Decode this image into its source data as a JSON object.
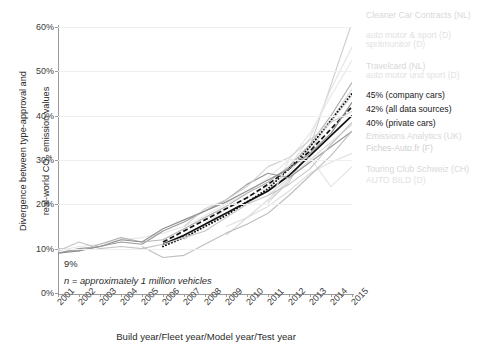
{
  "chart_data": {
    "type": "line",
    "title": "",
    "xlabel": "Build year/Fleet year/Model year/Test year",
    "ylabel": "Divergence between type-approval and real-world CO2 emission values",
    "ylabel_line1": "Divergence between type-approval and",
    "ylabel_line2_a": "real-world CO",
    "ylabel_line2_sub": "2",
    "ylabel_line2_b": " emission values",
    "categories": [
      "2001",
      "2002",
      "2003",
      "2004",
      "2005",
      "2006",
      "2007",
      "2008",
      "2009",
      "2010",
      "2011",
      "2012",
      "2013",
      "2014",
      "2015"
    ],
    "x": [
      2001,
      2002,
      2003,
      2004,
      2005,
      2006,
      2007,
      2008,
      2009,
      2010,
      2011,
      2012,
      2013,
      2014,
      2015
    ],
    "ylim": [
      0,
      60
    ],
    "yticks": [
      "0%",
      "10%",
      "20%",
      "30%",
      "40%",
      "50%",
      "60%"
    ],
    "ytick_values": [
      0,
      10,
      20,
      30,
      40,
      50,
      60
    ],
    "grid": true,
    "legend_position": "right-inline",
    "annotations": [
      {
        "text": "9%",
        "x": 2001,
        "y": 9
      },
      {
        "text": "n = approximately 1 million vehicles",
        "x": 2001,
        "y": 4,
        "italic": true
      }
    ],
    "series": [
      {
        "name": "Cleaner Car Contracts (NL)",
        "label": "Cleaner Car Contracts (NL)",
        "style": "solid",
        "color": "#cdcdcd",
        "weight": "faint",
        "values": [
          null,
          null,
          null,
          null,
          null,
          null,
          null,
          null,
          null,
          null,
          20.5,
          25.0,
          33.0,
          47.0,
          61.0
        ]
      },
      {
        "name": "auto motor & sport (D)",
        "label": "auto motor & sport (D)",
        "style": "solid",
        "color": "#e4e4e4",
        "weight": "faint2",
        "values": [
          null,
          null,
          null,
          null,
          null,
          null,
          12.0,
          15.5,
          19.0,
          21.5,
          24.0,
          28.5,
          35.0,
          46.0,
          55.5
        ]
      },
      {
        "name": "spritmonitor (D)",
        "label": "spritmonitor (D)",
        "style": "solid",
        "color": "#e8e8e8",
        "weight": "faint2",
        "values": [
          9.5,
          10.5,
          11.0,
          12.0,
          12.5,
          13.5,
          15.0,
          17.5,
          20.0,
          22.5,
          26.0,
          30.0,
          36.0,
          44.5,
          52.5
        ]
      },
      {
        "name": "Travelcard (NL)",
        "label": "Travelcard (NL)",
        "style": "solid",
        "color": "#d6d6d6",
        "weight": "faint",
        "values": [
          null,
          null,
          null,
          null,
          null,
          null,
          null,
          null,
          13.0,
          17.0,
          21.0,
          25.5,
          32.0,
          39.0,
          46.0
        ]
      },
      {
        "name": "auto motor und sport (D)",
        "label": "auto motor und sport (D)",
        "style": "solid",
        "color": "#e6e6e6",
        "weight": "faint2",
        "values": [
          null,
          null,
          null,
          null,
          null,
          null,
          null,
          16.0,
          18.0,
          20.0,
          23.0,
          27.0,
          33.0,
          38.5,
          44.5
        ]
      },
      {
        "name": "45% (company cars)",
        "label": "45% (company cars)",
        "style": "dotted",
        "color": "#111111",
        "weight": "dark",
        "values": [
          null,
          null,
          null,
          null,
          null,
          10.5,
          12.5,
          15.0,
          17.5,
          20.5,
          23.5,
          28.0,
          33.0,
          39.0,
          45.0
        ]
      },
      {
        "name": "42% (all data sources)",
        "label": "42% (all data sources)",
        "style": "dashed",
        "color": "#111111",
        "weight": "dark",
        "values": [
          null,
          null,
          null,
          null,
          null,
          11.5,
          14.0,
          16.5,
          19.0,
          21.5,
          24.5,
          28.0,
          32.0,
          37.0,
          42.0
        ]
      },
      {
        "name": "40% (private cars)",
        "label": "40% (private cars)",
        "style": "solid",
        "color": "#111111",
        "weight": "dark",
        "values": [
          null,
          null,
          null,
          null,
          null,
          11.0,
          13.0,
          15.5,
          18.0,
          20.5,
          23.0,
          26.5,
          31.0,
          35.5,
          40.0
        ]
      },
      {
        "name": "Emissions Analytics (UK)",
        "label": "Emissions Analytics (UK)",
        "style": "solid",
        "color": "#dcdcdc",
        "weight": "faint",
        "values": [
          null,
          null,
          null,
          null,
          null,
          null,
          null,
          null,
          null,
          null,
          22.0,
          26.0,
          30.0,
          34.0,
          38.0
        ]
      },
      {
        "name": "Fiches-Auto.fr (F)",
        "label": "Fiches-Auto.fr (F)",
        "style": "solid",
        "color": "#9a9a9a",
        "weight": "mid",
        "values": [
          9.0,
          10.0,
          10.5,
          11.5,
          11.0,
          14.0,
          16.0,
          18.5,
          21.0,
          24.5,
          27.0,
          26.0,
          29.5,
          33.0,
          36.5
        ]
      },
      {
        "name": "Touring Club Schweiz (CH)",
        "label": "Touring Club Schweiz (CH)",
        "style": "solid",
        "color": "#e0e0e0",
        "weight": "faint",
        "values": [
          null,
          null,
          null,
          null,
          null,
          null,
          null,
          null,
          15.0,
          17.0,
          19.5,
          23.0,
          27.0,
          29.5,
          31.5
        ]
      },
      {
        "name": "AUTO BILD (D)",
        "label": "AUTO BILD (D)",
        "style": "solid",
        "color": "#e4e4e4",
        "weight": "faint2",
        "values": [
          null,
          null,
          null,
          null,
          null,
          null,
          null,
          null,
          null,
          null,
          20.0,
          30.0,
          30.5,
          24.0,
          28.5
        ]
      },
      {
        "name": "unlabeled-grey-a",
        "label": "",
        "style": "solid",
        "color": "#b4b4b4",
        "weight": "mid",
        "values": [
          10.0,
          9.5,
          11.0,
          12.5,
          11.5,
          12.0,
          14.5,
          17.0,
          19.5,
          22.5,
          25.0,
          28.5,
          33.5,
          40.0,
          47.5
        ]
      },
      {
        "name": "unlabeled-grey-b",
        "label": "",
        "style": "solid",
        "color": "#c6c6c6",
        "weight": "mid",
        "values": [
          9.5,
          11.5,
          10.0,
          10.5,
          10.0,
          11.0,
          12.5,
          14.0,
          17.0,
          20.0,
          22.0,
          24.5,
          28.0,
          33.5,
          38.5
        ]
      },
      {
        "name": "unlabeled-grey-c",
        "label": "",
        "style": "solid",
        "color": "#bfbfbf",
        "weight": "mid",
        "values": [
          null,
          null,
          null,
          null,
          10.5,
          8.0,
          8.5,
          11.0,
          13.5,
          15.5,
          18.0,
          22.0,
          26.5,
          31.0,
          36.5
        ]
      },
      {
        "name": "unlabeled-grey-d",
        "label": "",
        "style": "solid",
        "color": "#d2d2d2",
        "weight": "faint",
        "values": [
          null,
          null,
          null,
          null,
          null,
          null,
          15.0,
          19.0,
          21.0,
          24.0,
          28.5,
          30.5,
          34.5,
          38.5,
          41.0
        ]
      },
      {
        "name": "unlabeled-grey-e",
        "label": "",
        "style": "solid",
        "color": "#8f8f8f",
        "weight": "mid",
        "values": [
          9.0,
          9.5,
          10.5,
          12.0,
          11.5,
          14.5,
          16.5,
          18.5,
          20.5,
          23.0,
          25.5,
          28.0,
          31.5,
          36.0,
          43.0
        ]
      }
    ],
    "labels_right": [
      {
        "text": "Cleaner Car Contracts (NL)",
        "tone": "faint",
        "x": 366,
        "y": 10
      },
      {
        "text": "auto motor & sport (D)",
        "tone": "faint2",
        "x": 366,
        "y": 30
      },
      {
        "text": "spritmonitor (D)",
        "tone": "faint2",
        "x": 366,
        "y": 39
      },
      {
        "text": "Travelcard (NL)",
        "tone": "faint",
        "x": 366,
        "y": 61
      },
      {
        "text": "auto motor und sport (D)",
        "tone": "faint2",
        "x": 366,
        "y": 70
      },
      {
        "text": "45% (company cars)",
        "tone": "dark",
        "x": 366,
        "y": 90
      },
      {
        "text": "42% (all data sources)",
        "tone": "dark",
        "x": 366,
        "y": 104
      },
      {
        "text": "40% (private cars)",
        "tone": "dark",
        "x": 366,
        "y": 118
      },
      {
        "text": "Emissions Analytics (UK)",
        "tone": "faint",
        "x": 366,
        "y": 131
      },
      {
        "text": "Fiches-Auto.fr (F)",
        "tone": "mid",
        "x": 366,
        "y": 143
      },
      {
        "text": "Touring Club Schweiz (CH)",
        "tone": "faint",
        "x": 366,
        "y": 164
      },
      {
        "text": "AUTO BILD (D)",
        "tone": "faint2",
        "x": 366,
        "y": 175
      }
    ]
  }
}
